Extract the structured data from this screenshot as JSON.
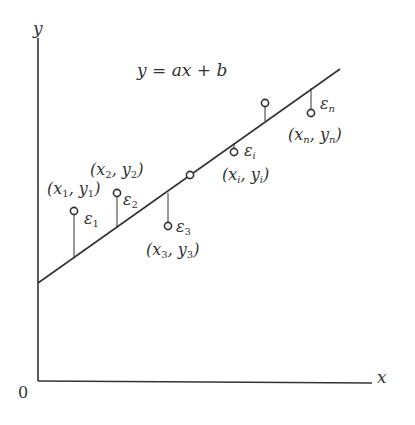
{
  "diagram": {
    "equation": "y = ax + b",
    "axes": {
      "x_label": "x",
      "y_label": "y",
      "origin_label": "0"
    },
    "colors": {
      "stroke": "#333333",
      "background": "#ffffff"
    },
    "line": {
      "x1": 38,
      "y1": 283,
      "x2": 340,
      "y2": 69
    },
    "points": [
      {
        "id": "p1",
        "label": "(x1, y1)",
        "label_sub": "1",
        "residual": "ε1",
        "residual_sub": "1",
        "cx": 74,
        "cy": 211,
        "line_y": 258
      },
      {
        "id": "p2",
        "label": "(x2, y2)",
        "label_sub": "2",
        "residual": "ε2",
        "residual_sub": "2",
        "cx": 117,
        "cy": 193,
        "line_y": 228
      },
      {
        "id": "p3",
        "label": "(x3, y3)",
        "label_sub": "3",
        "residual": "ε3",
        "residual_sub": "3",
        "cx": 168,
        "cy": 226,
        "line_y": 193
      },
      {
        "id": "p-on-line",
        "label": "",
        "residual": "",
        "cx": 190,
        "cy": 175,
        "line_y": 175
      },
      {
        "id": "pi",
        "label": "(xi, yi)",
        "label_sub": "i",
        "residual": "εi",
        "residual_sub": "i",
        "cx": 234,
        "cy": 152,
        "line_y": 143
      },
      {
        "id": "p-above",
        "label": "",
        "residual": "",
        "cx": 265,
        "cy": 103,
        "line_y": 121
      },
      {
        "id": "pn",
        "label": "(xn, yn)",
        "label_sub": "n",
        "residual": "εn",
        "residual_sub": "n",
        "cx": 311,
        "cy": 113,
        "line_y": 88
      }
    ]
  }
}
